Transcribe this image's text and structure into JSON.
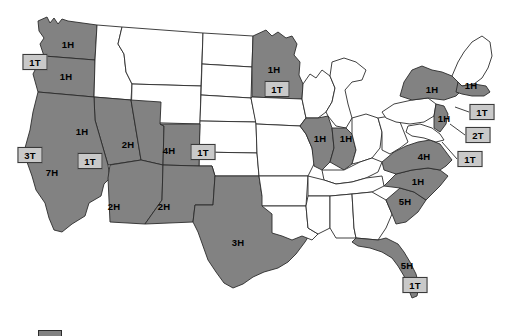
{
  "map": {
    "title": "United States Hurricane and Tornado Counts by State",
    "colors": {
      "shaded_state_fill": "#828282",
      "plain_state_fill": "#ffffff",
      "state_border": "#2b2b2b",
      "callout_box_fill": "#c9c9c9",
      "callout_box_border": "#3a3a3a",
      "label_text": "#000000",
      "background": "#ffffff"
    },
    "h_labels": [
      {
        "id": "wa",
        "state": "Washington",
        "text": "1H",
        "x": 68,
        "y": 44
      },
      {
        "id": "or",
        "state": "Oregon",
        "text": "1H",
        "x": 66,
        "y": 76
      },
      {
        "id": "nv",
        "state": "Nevada",
        "text": "1H",
        "x": 82,
        "y": 131
      },
      {
        "id": "ca",
        "state": "California",
        "text": "7H",
        "x": 52,
        "y": 172
      },
      {
        "id": "ut",
        "state": "Utah",
        "text": "2H",
        "x": 128,
        "y": 144
      },
      {
        "id": "co",
        "state": "Colorado",
        "text": "4H",
        "x": 169,
        "y": 150
      },
      {
        "id": "az",
        "state": "Arizona",
        "text": "2H",
        "x": 114,
        "y": 206
      },
      {
        "id": "nm",
        "state": "New Mexico",
        "text": "2H",
        "x": 164,
        "y": 206
      },
      {
        "id": "tx",
        "state": "Texas",
        "text": "3H",
        "x": 238,
        "y": 242
      },
      {
        "id": "mn",
        "state": "Minnesota",
        "text": "1H",
        "x": 274,
        "y": 69
      },
      {
        "id": "il",
        "state": "Illinois",
        "text": "1H",
        "x": 320,
        "y": 138
      },
      {
        "id": "in",
        "state": "Indiana",
        "text": "1H",
        "x": 346,
        "y": 138
      },
      {
        "id": "ny",
        "state": "New York",
        "text": "1H",
        "x": 432,
        "y": 89
      },
      {
        "id": "ma",
        "state": "Massachusetts",
        "text": "1H",
        "x": 471,
        "y": 85
      },
      {
        "id": "nj",
        "state": "New Jersey",
        "text": "1H",
        "x": 444,
        "y": 118
      },
      {
        "id": "va",
        "state": "Virginia",
        "text": "4H",
        "x": 424,
        "y": 156
      },
      {
        "id": "nc",
        "state": "North Carolina",
        "text": "1H",
        "x": 418,
        "y": 181
      },
      {
        "id": "sc",
        "state": "South Carolina",
        "text": "5H",
        "x": 405,
        "y": 201
      },
      {
        "id": "fl",
        "state": "Florida",
        "text": "5H",
        "x": 407,
        "y": 265
      }
    ],
    "t_callouts": [
      {
        "id": "wa-t",
        "state": "Washington",
        "text": "1T",
        "x": 35,
        "y": 62,
        "line": null
      },
      {
        "id": "ca-t",
        "state": "California",
        "text": "3T",
        "x": 30,
        "y": 155,
        "line": null
      },
      {
        "id": "nv-t",
        "state": "Nevada",
        "text": "1T",
        "x": 90,
        "y": 161,
        "line": null
      },
      {
        "id": "co-t",
        "state": "Colorado",
        "text": "1T",
        "x": 203,
        "y": 152,
        "line": null
      },
      {
        "id": "mn-t",
        "state": "Minnesota",
        "text": "1T",
        "x": 277,
        "y": 89,
        "line": null
      },
      {
        "id": "ma-t",
        "state": "Massachusetts",
        "text": "1T",
        "x": 482,
        "y": 112,
        "line": [
          469,
          112,
          455,
          107
        ]
      },
      {
        "id": "nj-t",
        "state": "New Jersey",
        "text": "2T",
        "x": 478,
        "y": 135,
        "line": [
          465,
          135,
          450,
          124
        ]
      },
      {
        "id": "va-t",
        "state": "Virginia",
        "text": "1T",
        "x": 470,
        "y": 159,
        "line": [
          457,
          159,
          442,
          142
        ]
      },
      {
        "id": "fl-t",
        "state": "Florida",
        "text": "1T",
        "x": 415,
        "y": 285,
        "line": null
      }
    ],
    "legend": {
      "swatch_label": "legend-color-swatch",
      "x": 38,
      "y": 330,
      "width": 24,
      "height": 7
    }
  }
}
